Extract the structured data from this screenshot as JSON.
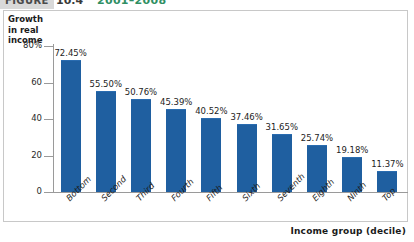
{
  "header": {
    "tab_label": "FIGURE",
    "figure_number": "10.4",
    "years": "2001–2008"
  },
  "figure": {
    "y_axis_title": "Growth in real income",
    "x_axis_title": "Income group (decile)"
  },
  "colors": {
    "bar": "#1f5fa0",
    "axis": "#9a9a9a",
    "frame": "#c8c8c8",
    "header_green": "#2f8f63"
  },
  "chart_data": {
    "type": "bar",
    "title": "",
    "xlabel": "Income group (decile)",
    "ylabel": "Growth in real income",
    "ylim": [
      0,
      80
    ],
    "yticks": [
      "0",
      "20",
      "40",
      "60",
      "80%"
    ],
    "ytick_values": [
      0,
      20,
      40,
      60,
      80
    ],
    "grid": false,
    "legend": "none",
    "categories": [
      "Bottom",
      "Second",
      "Third",
      "Fourth",
      "Fifth",
      "Sixth",
      "Seventh",
      "Eighth",
      "Ninth",
      "Top"
    ],
    "values": [
      72.45,
      55.5,
      50.76,
      45.39,
      40.52,
      37.46,
      31.65,
      25.74,
      19.18,
      11.37
    ],
    "data_labels": [
      "72.45%",
      "55.50%",
      "50.76%",
      "45.39%",
      "40.52%",
      "37.46%",
      "31.65%",
      "25.74%",
      "19.18%",
      "11.37%"
    ]
  }
}
